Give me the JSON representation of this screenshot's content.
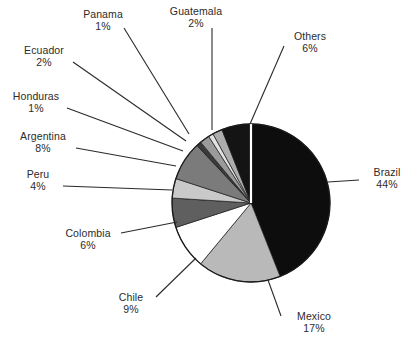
{
  "chart_data": {
    "type": "pie",
    "title": "",
    "xlabel": "",
    "ylabel": "",
    "legend_position": "none",
    "grid": false,
    "labels_show_percent": true,
    "start_angle_deg": 0,
    "direction": "clockwise",
    "categories": [
      "Brazil",
      "Mexico",
      "Chile",
      "Colombia",
      "Peru",
      "Argentina",
      "Honduras",
      "Ecuador",
      "Panama",
      "Guatemala",
      "Others"
    ],
    "values": [
      44,
      17,
      9,
      6,
      4,
      8,
      1,
      2,
      1,
      2,
      6
    ],
    "unit": "%",
    "slices": [
      {
        "name": "Brazil",
        "value": 44,
        "percent_label": "44%",
        "color": "#0d0d0d"
      },
      {
        "name": "Mexico",
        "value": 17,
        "percent_label": "17%",
        "color": "#b9b9b9"
      },
      {
        "name": "Chile",
        "value": 9,
        "percent_label": "9%",
        "color": "#ffffff"
      },
      {
        "name": "Colombia",
        "value": 6,
        "percent_label": "6%",
        "color": "#5f5f5f"
      },
      {
        "name": "Peru",
        "value": 4,
        "percent_label": "4%",
        "color": "#c9c9c9"
      },
      {
        "name": "Argentina",
        "value": 8,
        "percent_label": "8%",
        "color": "#7b7b7b"
      },
      {
        "name": "Honduras",
        "value": 1,
        "percent_label": "1%",
        "color": "#3a3a3a"
      },
      {
        "name": "Ecuador",
        "value": 2,
        "percent_label": "2%",
        "color": "#9a9a9a"
      },
      {
        "name": "Panama",
        "value": 1,
        "percent_label": "1%",
        "color": "#e2e2e2"
      },
      {
        "name": "Guatemala",
        "value": 2,
        "percent_label": "2%",
        "color": "#adadad"
      },
      {
        "name": "Others",
        "value": 6,
        "percent_label": "6%",
        "color": "#141414"
      }
    ]
  },
  "labels": {
    "panama": {
      "name": "Panama",
      "pct": "1%"
    },
    "guatemala": {
      "name": "Guatemala",
      "pct": "2%"
    },
    "others": {
      "name": "Others",
      "pct": "6%"
    },
    "ecuador": {
      "name": "Ecuador",
      "pct": "2%"
    },
    "honduras": {
      "name": "Honduras",
      "pct": "1%"
    },
    "argentina": {
      "name": "Argentina",
      "pct": "8%"
    },
    "peru": {
      "name": "Peru",
      "pct": "4%"
    },
    "colombia": {
      "name": "Colombia",
      "pct": "6%"
    },
    "chile": {
      "name": "Chile",
      "pct": "9%"
    },
    "mexico": {
      "name": "Mexico",
      "pct": "17%"
    },
    "brazil": {
      "name": "Brazil",
      "pct": "44%"
    }
  },
  "style": {
    "outline_color": "#1a1a1a",
    "separator_color": "#ffffff",
    "leader_color": "#2a2a2a",
    "background": "#ffffff"
  },
  "geometry": {
    "center_x": 251,
    "center_y": 203,
    "radius": 79
  }
}
